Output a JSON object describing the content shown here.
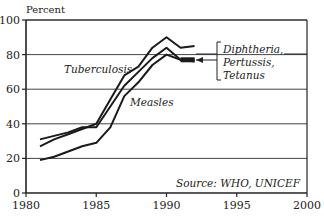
{
  "chart_data": {
    "type": "line",
    "title": "",
    "xlabel": "",
    "ylabel": "Percent",
    "xlim": [
      1980,
      2000
    ],
    "ylim": [
      0,
      100
    ],
    "x_ticks": [
      1980,
      1985,
      1990,
      1995,
      2000
    ],
    "x_tick_labels": [
      "1980",
      "1985",
      "1990",
      "1995",
      "2000"
    ],
    "y_ticks": [
      0,
      20,
      40,
      60,
      80,
      100
    ],
    "y_tick_labels": [
      "0",
      "20",
      "40",
      "60",
      "80",
      "100"
    ],
    "grid": "horizontal",
    "x": [
      1981,
      1982,
      1983,
      1984,
      1985,
      1986,
      1987,
      1988,
      1989,
      1990,
      1991,
      1992
    ],
    "series": [
      {
        "name": "Tuberculosis",
        "values": [
          27,
          31,
          34,
          37,
          40,
          54,
          68,
          73,
          84,
          90,
          84,
          85
        ]
      },
      {
        "name": "Diphtheria, Pertussis, Tetanus",
        "values": [
          31,
          33,
          35,
          38,
          38,
          50,
          62,
          70,
          78,
          84,
          77,
          77
        ]
      },
      {
        "name": "Measles",
        "values": [
          19,
          21,
          24,
          27,
          29,
          38,
          56,
          64,
          74,
          80,
          77,
          76
        ]
      }
    ],
    "annotations": {
      "tuberculosis_label": "Tuberculosis",
      "measles_label": "Measles",
      "dpt_label_lines": [
        "Diphtheria,",
        "Pertussis,",
        "Tetanus"
      ],
      "source": "Source: WHO, UNICEF"
    },
    "legend": "inline labels"
  }
}
